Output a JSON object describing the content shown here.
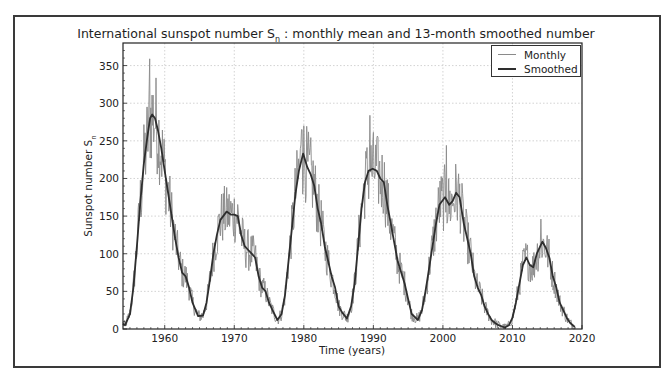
{
  "chart_data": {
    "type": "line",
    "title_main": "International sunspot number S",
    "title_sub": "n",
    "title_rest": " : monthly mean and 13-month smoothed number",
    "xlabel": "Time (years)",
    "ylabel_main": "Sunspot number S",
    "ylabel_sub": "n",
    "xlim": [
      1954,
      2020
    ],
    "ylim": [
      0,
      380
    ],
    "xticks": [
      1960,
      1970,
      1980,
      1990,
      2000,
      2010,
      2020
    ],
    "yticks": [
      0,
      50,
      100,
      150,
      200,
      250,
      300,
      350
    ],
    "grid": true,
    "legend_position": "upper right",
    "legend": [
      "Monthly",
      "Smoothed"
    ],
    "colors": {
      "monthly": "#8a8a8a",
      "smoothed": "#2e2e2e",
      "grid": "#c8c8c8",
      "axis": "#222222"
    },
    "series": [
      {
        "name": "Smoothed",
        "x": [
          1954.0,
          1954.3,
          1955.0,
          1955.5,
          1956.0,
          1956.5,
          1957.0,
          1957.5,
          1957.9,
          1958.2,
          1958.6,
          1959.0,
          1959.5,
          1960.0,
          1960.5,
          1961.0,
          1961.5,
          1962.0,
          1962.5,
          1963.0,
          1963.5,
          1964.0,
          1964.8,
          1965.5,
          1966.0,
          1966.5,
          1967.0,
          1967.5,
          1968.0,
          1968.9,
          1969.5,
          1970.0,
          1970.5,
          1971.0,
          1971.5,
          1972.0,
          1972.5,
          1973.0,
          1973.5,
          1974.0,
          1974.5,
          1975.0,
          1975.5,
          1976.2,
          1976.8,
          1977.3,
          1977.8,
          1978.3,
          1978.8,
          1979.3,
          1979.9,
          1980.5,
          1981.0,
          1981.5,
          1982.0,
          1982.5,
          1983.0,
          1983.5,
          1984.0,
          1984.5,
          1985.0,
          1985.5,
          1986.2,
          1986.8,
          1987.3,
          1987.8,
          1988.3,
          1988.8,
          1989.3,
          1989.9,
          1990.5,
          1991.0,
          1991.5,
          1992.0,
          1992.5,
          1993.0,
          1993.5,
          1994.0,
          1994.5,
          1995.0,
          1995.5,
          1996.4,
          1997.0,
          1997.5,
          1998.0,
          1998.5,
          1999.0,
          1999.5,
          2000.3,
          2000.9,
          2001.4,
          2001.9,
          2002.4,
          2003.0,
          2003.5,
          2004.0,
          2004.5,
          2005.0,
          2005.5,
          2006.0,
          2006.5,
          2007.0,
          2007.5,
          2008.0,
          2008.9,
          2009.5,
          2010.0,
          2010.5,
          2011.0,
          2011.5,
          2012.0,
          2012.5,
          2013.0,
          2013.5,
          2014.3,
          2014.8,
          2015.3,
          2015.8,
          2016.3,
          2016.8,
          2017.3,
          2017.8,
          2018.3,
          2018.8,
          2019.0
        ],
        "values": [
          7,
          5,
          20,
          55,
          110,
          170,
          220,
          255,
          280,
          285,
          280,
          265,
          240,
          210,
          180,
          150,
          120,
          95,
          75,
          70,
          55,
          35,
          17,
          18,
          35,
          65,
          100,
          125,
          145,
          156,
          152,
          152,
          150,
          125,
          110,
          105,
          100,
          95,
          70,
          55,
          50,
          35,
          25,
          12,
          20,
          45,
          90,
          135,
          180,
          210,
          233,
          215,
          205,
          190,
          160,
          140,
          110,
          90,
          70,
          55,
          30,
          22,
          14,
          30,
          60,
          110,
          160,
          195,
          210,
          213,
          210,
          200,
          195,
          165,
          140,
          115,
          90,
          75,
          60,
          40,
          20,
          12,
          25,
          50,
          80,
          110,
          140,
          165,
          175,
          165,
          170,
          181,
          175,
          140,
          120,
          100,
          70,
          55,
          45,
          30,
          20,
          12,
          8,
          5,
          2,
          5,
          15,
          35,
          60,
          85,
          95,
          85,
          82,
          100,
          116,
          108,
          95,
          70,
          55,
          35,
          25,
          15,
          8,
          4,
          3
        ]
      },
      {
        "name": "Monthly",
        "note": "monthly means fluctuate around the smoothed curve; notable monthly maxima listed",
        "peaks": [
          {
            "x": 1957.8,
            "y": 359
          },
          {
            "x": 1968.9,
            "y": 188
          },
          {
            "x": 1979.7,
            "y": 265
          },
          {
            "x": 1989.5,
            "y": 284
          },
          {
            "x": 2000.5,
            "y": 244
          },
          {
            "x": 2014.1,
            "y": 146
          }
        ]
      }
    ]
  }
}
